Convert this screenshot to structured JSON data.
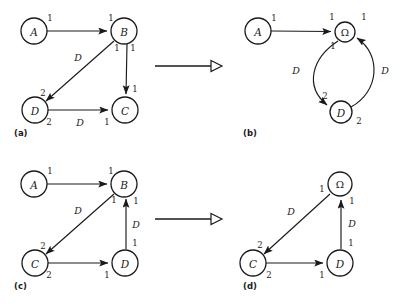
{
  "figure": {
    "background": "#ffffff",
    "ink": "#1a1a1a"
  },
  "panels": [
    {
      "id": "a",
      "caption": "(a)",
      "nodes": [
        {
          "id": "A",
          "label": "A",
          "cx": 34,
          "cy": 31,
          "r": 13
        },
        {
          "id": "B",
          "label": "B",
          "cx": 124,
          "cy": 31,
          "r": 13
        },
        {
          "id": "D",
          "label": "D",
          "cx": 35,
          "cy": 110,
          "r": 13
        },
        {
          "id": "C",
          "label": "C",
          "cx": 125,
          "cy": 110,
          "r": 13
        }
      ],
      "edges": [
        {
          "from": "A",
          "to": "B",
          "tail_port": "1",
          "head_port": "1",
          "edge_label": ""
        },
        {
          "from": "B",
          "to": "D",
          "tail_port": "1",
          "head_port": "2",
          "edge_label": "D"
        },
        {
          "from": "B",
          "to": "C",
          "tail_port": "1",
          "head_port": "1",
          "edge_label": ""
        },
        {
          "from": "D",
          "to": "C",
          "tail_port": "2",
          "head_port": "1",
          "edge_label": "D"
        }
      ]
    },
    {
      "id": "b",
      "caption": "(b)",
      "nodes": [
        {
          "id": "A",
          "label": "A",
          "cx": 258,
          "cy": 31,
          "r": 13
        },
        {
          "id": "OM",
          "label": "Ω",
          "cx": 345,
          "cy": 32,
          "r": 10
        },
        {
          "id": "D",
          "label": "D",
          "cx": 341,
          "cy": 112,
          "r": 11
        }
      ],
      "edges": [
        {
          "from": "A",
          "to": "OM",
          "tail_port": "1",
          "head_port": "1",
          "edge_label": ""
        },
        {
          "from": "OM",
          "to": "D",
          "tail_port": "1",
          "head_port": "2",
          "edge_label": "D"
        },
        {
          "from": "D",
          "to": "OM",
          "tail_port": "2",
          "head_port": "1",
          "edge_label": "D"
        }
      ]
    },
    {
      "id": "c",
      "caption": "(c)",
      "nodes": [
        {
          "id": "A",
          "label": "A",
          "cx": 34,
          "cy": 184,
          "r": 13
        },
        {
          "id": "B",
          "label": "B",
          "cx": 124,
          "cy": 184,
          "r": 13
        },
        {
          "id": "C",
          "label": "C",
          "cx": 35,
          "cy": 263,
          "r": 13
        },
        {
          "id": "D",
          "label": "D",
          "cx": 125,
          "cy": 263,
          "r": 13
        }
      ],
      "edges": [
        {
          "from": "A",
          "to": "B",
          "tail_port": "1",
          "head_port": "1",
          "edge_label": ""
        },
        {
          "from": "B",
          "to": "C",
          "tail_port": "1",
          "head_port": "2",
          "edge_label": "D"
        },
        {
          "from": "D",
          "to": "B",
          "tail_port": "1",
          "head_port": "1",
          "edge_label": "D"
        },
        {
          "from": "C",
          "to": "D",
          "tail_port": "2",
          "head_port": "1",
          "edge_label": ""
        }
      ]
    },
    {
      "id": "d",
      "caption": "(d)",
      "nodes": [
        {
          "id": "OM",
          "label": "Ω",
          "cx": 340,
          "cy": 184,
          "r": 12
        },
        {
          "id": "C",
          "label": "C",
          "cx": 253,
          "cy": 263,
          "r": 13
        },
        {
          "id": "D",
          "label": "D",
          "cx": 340,
          "cy": 263,
          "r": 13
        }
      ],
      "edges": [
        {
          "from": "OM",
          "to": "C",
          "tail_port": "1",
          "head_port": "2",
          "edge_label": "D"
        },
        {
          "from": "D",
          "to": "OM",
          "tail_port": "1",
          "head_port": "1",
          "edge_label": "D"
        },
        {
          "from": "C",
          "to": "D",
          "tail_port": "2",
          "head_port": "1",
          "edge_label": ""
        }
      ]
    }
  ],
  "transform_arrows": [
    {
      "id": "arrow-top",
      "x1": 155,
      "y1": 66,
      "x2": 222,
      "y2": 66
    },
    {
      "id": "arrow-bottom",
      "x1": 155,
      "y1": 219,
      "x2": 222,
      "y2": 219
    }
  ],
  "labels": {
    "a": {
      "A_out_1": "1",
      "B_in_1": "1",
      "B_diag_1": "1",
      "B_down_1": "1",
      "D_in_2": "2",
      "diag_D": "D",
      "C_in_1_top": "1",
      "D_out_2": "2",
      "bottom_D": "D",
      "C_in_1": "1",
      "caption": "(a)"
    },
    "b": {
      "A_out_1": "1",
      "OM_in_1_left": "1",
      "OM_in_1_right": "1",
      "OM_out_1": "1",
      "left_D": "D",
      "right_D": "D",
      "D_in_2": "2",
      "D_out_2": "2",
      "caption": "(b)"
    },
    "c": {
      "A_out_1": "1",
      "B_in_1": "1",
      "B_diag_1": "1",
      "B_up_1": "1",
      "C_in_2": "2",
      "diag_D": "D",
      "vert_D": "D",
      "D_out_1": "1",
      "C_out_2": "2",
      "D_in_1": "1",
      "caption": "(c)"
    },
    "d": {
      "OM_out_1": "1",
      "OM_in_1": "1",
      "C_in_2": "2",
      "diag_D": "D",
      "vert_D": "D",
      "D_out_1": "1",
      "C_out_2": "2",
      "D_in_1": "1",
      "caption": "(d)"
    }
  }
}
